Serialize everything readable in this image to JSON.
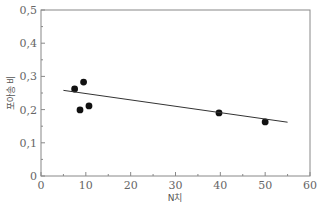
{
  "chart_data": {
    "type": "scatter",
    "title": "",
    "xlabel": "N치",
    "ylabel": "포아송 비",
    "xlim": [
      0,
      60
    ],
    "ylim": [
      0,
      0.5
    ],
    "xticks": [
      0,
      10,
      20,
      30,
      40,
      50,
      60
    ],
    "yticks": [
      0,
      0.1,
      0.2,
      0.3,
      0.4,
      0.5
    ],
    "xtick_labels": [
      "0",
      "10",
      "20",
      "30",
      "40",
      "50",
      "60"
    ],
    "ytick_labels": [
      "0",
      "0,1",
      "0,2",
      "0,3",
      "0,4",
      "0,5"
    ],
    "grid": false,
    "legend": null,
    "series": [
      {
        "name": "measured",
        "type": "scatter",
        "x": [
          7.5,
          9.5,
          8.7,
          10.7,
          39.7,
          50.0
        ],
        "y": [
          0.262,
          0.283,
          0.199,
          0.211,
          0.19,
          0.163
        ]
      },
      {
        "name": "trend",
        "type": "line",
        "x": [
          5,
          55
        ],
        "y": [
          0.258,
          0.162
        ]
      }
    ]
  }
}
